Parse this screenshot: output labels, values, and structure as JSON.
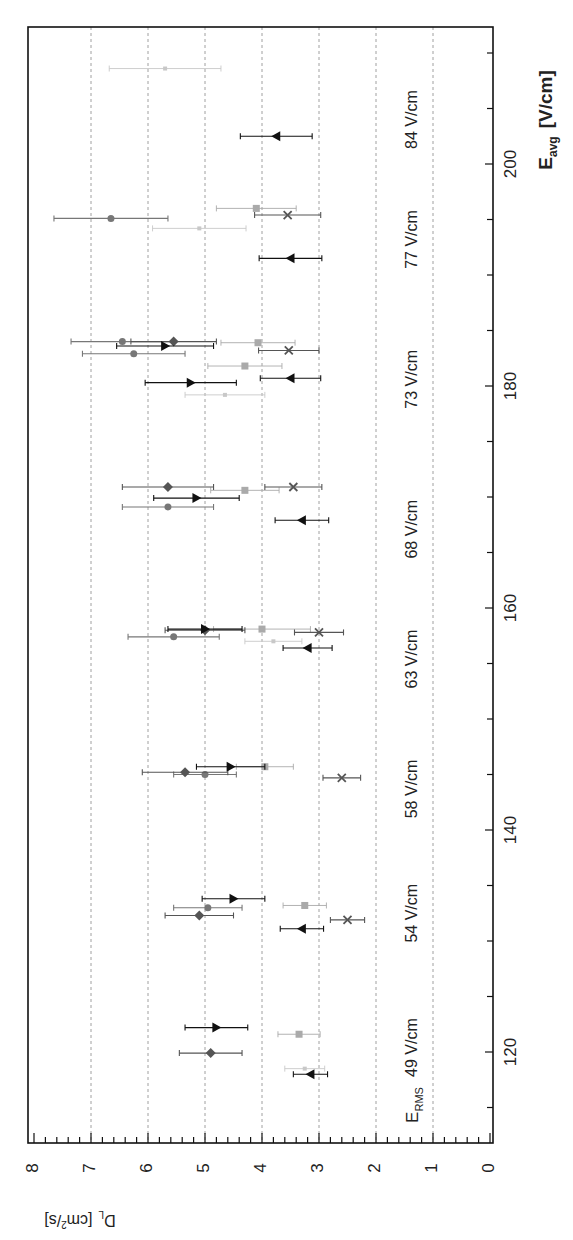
{
  "chart_data": {
    "type": "scatter",
    "orientation_note": "figure rotated: E_avg axis runs vertically (increasing upward), D_L axis runs horizontally (increasing leftward)",
    "title": "",
    "xlabel": "E_avg [V/cm]",
    "ylabel": "D_L [cm^2/s]",
    "xlim": [
      112,
      212
    ],
    "ylim": [
      0,
      8
    ],
    "x_ticks": [
      120,
      140,
      160,
      180,
      200
    ],
    "y_ticks": [
      0,
      1,
      2,
      3,
      4,
      5,
      6,
      7,
      8
    ],
    "grid": "dashed lines at each integer D_L",
    "erms_header": "E_RMS",
    "erms_groups": [
      {
        "label": "49 V/cm",
        "e_center": 120.4
      },
      {
        "label": "54 V/cm",
        "e_center": 132.5
      },
      {
        "label": "58 V/cm",
        "e_center": 143.7
      },
      {
        "label": "63 V/cm",
        "e_center": 155.4
      },
      {
        "label": "68 V/cm",
        "e_center": 167.1
      },
      {
        "label": "73 V/cm",
        "e_center": 180.6
      },
      {
        "label": "77 V/cm",
        "e_center": 193.2
      },
      {
        "label": "84 V/cm",
        "e_center": 204.0
      }
    ],
    "series": [
      {
        "name": "diamond",
        "marker": "diamond",
        "color": "#555555",
        "points": [
          [
            119.9,
            4.9,
            0.55
          ],
          [
            132.3,
            5.1,
            0.6
          ],
          [
            145.2,
            5.35,
            0.75
          ],
          [
            158.0,
            5.0,
            0.7
          ],
          [
            170.9,
            5.65,
            0.8
          ],
          [
            184.0,
            5.55,
            0.75
          ]
        ]
      },
      {
        "name": "circle",
        "marker": "circle",
        "color": "#777777",
        "points": [
          [
            133.0,
            4.95,
            0.6
          ],
          [
            145.0,
            5.0,
            0.55
          ],
          [
            157.4,
            5.55,
            0.8
          ],
          [
            169.1,
            5.65,
            0.8
          ],
          [
            182.9,
            6.25,
            0.9
          ],
          [
            184.0,
            6.45,
            0.9
          ],
          [
            195.1,
            6.65,
            1.0
          ]
        ]
      },
      {
        "name": "right-triangle",
        "marker": "triangle-right",
        "color": "#111111",
        "points": [
          [
            122.2,
            4.8,
            0.55
          ],
          [
            133.8,
            4.5,
            0.55
          ],
          [
            145.7,
            4.55,
            0.6
          ],
          [
            158.1,
            5.0,
            0.65
          ],
          [
            169.9,
            5.15,
            0.75
          ],
          [
            180.3,
            5.25,
            0.8
          ],
          [
            183.6,
            5.7,
            0.85
          ]
        ]
      },
      {
        "name": "left-triangle",
        "marker": "triangle-left",
        "color": "#111111",
        "points": [
          [
            118.0,
            3.15,
            0.3
          ],
          [
            131.1,
            3.3,
            0.38
          ],
          [
            156.4,
            3.2,
            0.43
          ],
          [
            167.9,
            3.3,
            0.47
          ],
          [
            180.7,
            3.5,
            0.53
          ],
          [
            191.5,
            3.5,
            0.55
          ],
          [
            202.5,
            3.75,
            0.63
          ]
        ]
      },
      {
        "name": "x-cross",
        "marker": "x",
        "color": "#555555",
        "points": [
          [
            131.9,
            2.5,
            0.3
          ],
          [
            144.7,
            2.6,
            0.33
          ],
          [
            157.8,
            3.0,
            0.43
          ],
          [
            170.9,
            3.45,
            0.5
          ],
          [
            183.2,
            3.53,
            0.53
          ],
          [
            195.4,
            3.55,
            0.58
          ]
        ]
      },
      {
        "name": "gray-square",
        "marker": "square",
        "color": "#aaaaaa",
        "points": [
          [
            121.6,
            3.35,
            0.37
          ],
          [
            133.2,
            3.25,
            0.38
          ],
          [
            145.7,
            3.95,
            0.5
          ],
          [
            158.1,
            4.0,
            0.85
          ],
          [
            170.6,
            4.3,
            0.6
          ],
          [
            181.8,
            4.3,
            0.65
          ],
          [
            183.9,
            4.07,
            0.65
          ],
          [
            196.0,
            4.1,
            0.7
          ]
        ]
      },
      {
        "name": "light-point",
        "marker": "small-square",
        "color": "#c8c8c8",
        "points": [
          [
            118.5,
            3.25,
            0.35
          ],
          [
            157.0,
            3.8,
            0.5
          ],
          [
            179.2,
            4.65,
            0.7
          ],
          [
            194.2,
            5.1,
            0.82
          ],
          [
            208.6,
            5.7,
            0.98
          ]
        ]
      }
    ]
  },
  "labels": {
    "x_axis_title_main": "E",
    "x_axis_title_sub": "avg",
    "x_axis_title_unit": "[V/cm]",
    "y_axis_title_main": "D",
    "y_axis_title_sub": "L",
    "y_axis_title_unit": "[cm",
    "y_axis_title_sup": "2",
    "y_axis_title_tail": "/s]",
    "erms_main": "E",
    "erms_sub": "RMS"
  }
}
